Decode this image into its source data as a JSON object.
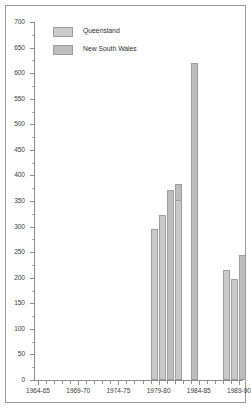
{
  "chart_data": {
    "type": "bar",
    "title": "",
    "subtitle": "",
    "xlabel": "",
    "ylabel": "",
    "ylim": [
      0,
      700
    ],
    "ytick_step": 50,
    "yticks": [
      0,
      50,
      100,
      150,
      200,
      250,
      300,
      350,
      400,
      450,
      500,
      550,
      600,
      650,
      700
    ],
    "ytick_labels": [
      "0",
      "50",
      "100",
      "150",
      "200",
      "250",
      "300",
      "350",
      "400",
      "450",
      "500",
      "550",
      "600",
      "650",
      "700"
    ],
    "grid": false,
    "legend_position": "top-left",
    "legend": [
      {
        "name": "Queensland",
        "color": "#cccccc"
      },
      {
        "name": "New South Wales",
        "color": "#bdbdbd"
      }
    ],
    "categories": [
      "1964-65",
      "1965-66",
      "1966-67",
      "1967-68",
      "1968-69",
      "1969-70",
      "1970-71",
      "1971-72",
      "1972-73",
      "1973-74",
      "1974-75",
      "1975-76",
      "1976-77",
      "1977-78",
      "1978-79",
      "1979-80",
      "1980-81",
      "1981-82",
      "1982-83",
      "1983-84",
      "1984-85",
      "1985-86",
      "1986-87",
      "1987-88",
      "1988-89",
      "1989-90"
    ],
    "xtick_labels": [
      "1964-65",
      "1969-70",
      "1974-75",
      "1979-80",
      "1984-85",
      "1989-90"
    ],
    "xtick_label_indices": [
      0,
      5,
      10,
      15,
      20,
      25
    ],
    "bars": [
      {
        "category": "1979-80",
        "series": "Queensland",
        "value": 295
      },
      {
        "category": "1980-81",
        "series": "New South Wales",
        "value": 372
      },
      {
        "category": "1980-81",
        "series": "Queensland",
        "value": 322
      },
      {
        "category": "1981-82",
        "series": "New South Wales",
        "value": 383
      },
      {
        "category": "1982-83",
        "series": "Queensland",
        "value": 352
      },
      {
        "category": "1983-84",
        "series": "New South Wales",
        "value": 620
      },
      {
        "category": "1988-89",
        "series": "Queensland",
        "value": 215
      },
      {
        "category": "1989-90",
        "series": "New South Wales",
        "value": 245
      },
      {
        "category": "1989-90",
        "series": "Queensland",
        "value": 197
      }
    ],
    "series": [
      {
        "name": "Queensland",
        "color": "#cccccc",
        "values": [
          null,
          null,
          null,
          null,
          null,
          null,
          null,
          null,
          null,
          null,
          null,
          null,
          null,
          null,
          null,
          295,
          322,
          null,
          352,
          null,
          null,
          null,
          null,
          null,
          215,
          197
        ]
      },
      {
        "name": "New South Wales",
        "color": "#bdbdbd",
        "values": [
          null,
          null,
          null,
          null,
          null,
          null,
          null,
          null,
          null,
          null,
          null,
          null,
          null,
          null,
          null,
          null,
          372,
          383,
          null,
          620,
          null,
          null,
          null,
          null,
          null,
          245
        ]
      }
    ]
  },
  "colors": {
    "axis": "#8d8d8d",
    "frame": "#9a9a9a",
    "bar_edge": "#9d9d9d",
    "text": "#3a3a3a",
    "background": "#ffffff"
  }
}
